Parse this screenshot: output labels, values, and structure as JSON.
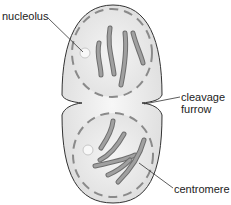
{
  "diagram": {
    "type": "cell division (telophase/cytokinesis)",
    "labels": {
      "nucleolus": "nucleolus",
      "cleavage_furrow_line1": "cleavage",
      "cleavage_furrow_line2": "furrow",
      "centromere": "centromere"
    },
    "colors": {
      "cell_fill": "#ececec",
      "cell_outline": "#333333",
      "nuclear_envelope": "#8a8a8a",
      "chromosome": "#9a9a9a",
      "chromosome_outline": "#6e6e6e",
      "leader_line": "#333333"
    }
  }
}
